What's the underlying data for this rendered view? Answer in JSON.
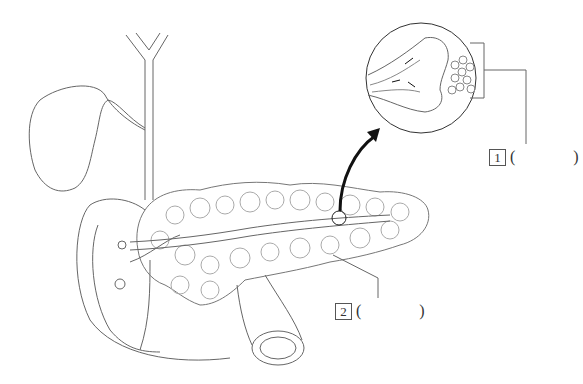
{
  "diagram": {
    "labels": [
      {
        "number": "1",
        "open": "(",
        "answer": "",
        "close": ")"
      },
      {
        "number": "2",
        "open": "(",
        "answer": "",
        "close": ")"
      }
    ],
    "structures": [
      "gallbladder",
      "bile duct",
      "duodenum",
      "pancreas",
      "pancreatic duct",
      "magnified view",
      "arrow"
    ],
    "colors": {
      "line": "#555555",
      "arrow": "#111111",
      "background": "#ffffff"
    }
  }
}
